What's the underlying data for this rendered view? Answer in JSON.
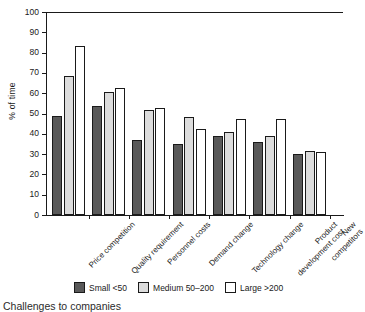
{
  "chart_data": {
    "type": "bar",
    "title": "",
    "subtitle": "",
    "xlabel": "",
    "ylabel": "% of time",
    "ylim": [
      0,
      100
    ],
    "yticks": [
      0,
      10,
      20,
      30,
      40,
      50,
      60,
      70,
      80,
      90,
      100
    ],
    "grid": false,
    "legend_position": "bottom",
    "categories": [
      "Price competition",
      "Quality requirement",
      "Personnel costs",
      "Demand change",
      "Technology change",
      "Product\ndevelopment cost",
      "New competitors"
    ],
    "series": [
      {
        "name": "Small <50",
        "color": "#595959",
        "values": [
          49,
          53.5,
          37,
          35,
          39,
          36,
          30
        ]
      },
      {
        "name": "Medium 50–200",
        "color": "#dcdcdc",
        "values": [
          68.5,
          60.5,
          51.5,
          48.5,
          41,
          39,
          31.5
        ]
      },
      {
        "name": "Large >200",
        "color": "#ffffff",
        "values": [
          83.5,
          62.5,
          52.5,
          42.5,
          47.5,
          47.5,
          31
        ]
      }
    ]
  },
  "caption": "Challenges to companies"
}
